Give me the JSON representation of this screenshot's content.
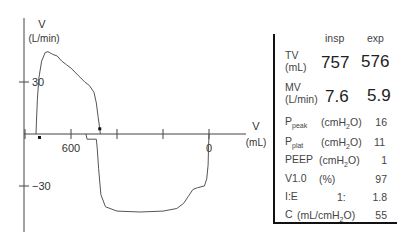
{
  "chart_data": {
    "type": "line",
    "ylabel": "V",
    "ylabel_unit": "(L/min)",
    "xlabel": "V",
    "xlabel_unit": "(mL)",
    "x_direction": "reversed",
    "xlim": [
      1100,
      -100
    ],
    "ylim": [
      -45,
      50
    ],
    "x_ticks": [
      800,
      600,
      400,
      200,
      0
    ],
    "x_tick_labels": [
      {
        "value": 600,
        "label": "600"
      },
      {
        "value": 0,
        "label": "0"
      }
    ],
    "y_ticks": [
      30,
      -30
    ],
    "y_tick_labels": [
      "30",
      "-30"
    ],
    "series": [
      {
        "name": "inspiration",
        "points": [
          [
            752,
            0
          ],
          [
            750,
            8
          ],
          [
            746,
            20
          ],
          [
            740,
            32
          ],
          [
            728,
            42
          ],
          [
            712,
            47
          ],
          [
            700,
            47.5
          ],
          [
            680,
            46
          ],
          [
            660,
            45
          ],
          [
            640,
            42
          ],
          [
            620,
            40
          ],
          [
            600,
            38
          ],
          [
            570,
            34
          ],
          [
            540,
            30
          ],
          [
            520,
            28
          ],
          [
            500,
            24
          ],
          [
            490,
            18
          ],
          [
            482,
            10
          ],
          [
            476,
            4
          ],
          [
            472,
            0
          ]
        ]
      },
      {
        "name": "expiration",
        "points": [
          [
            0,
            0
          ],
          [
            2,
            -8
          ],
          [
            4,
            -18
          ],
          [
            10,
            -26
          ],
          [
            20,
            -30
          ],
          [
            50,
            -31
          ],
          [
            70,
            -32
          ],
          [
            90,
            -36
          ],
          [
            110,
            -40
          ],
          [
            140,
            -43
          ],
          [
            200,
            -44.5
          ],
          [
            300,
            -45
          ],
          [
            400,
            -44.5
          ],
          [
            450,
            -42
          ],
          [
            470,
            -35
          ],
          [
            480,
            -20
          ],
          [
            486,
            -8
          ],
          [
            490,
            -3
          ],
          [
            530,
            -3
          ],
          [
            535,
            0
          ]
        ]
      }
    ],
    "markers": [
      {
        "x": 475,
        "y": 3
      },
      {
        "x": 737,
        "y": -2
      }
    ],
    "grid": false
  },
  "panel": {
    "headers": {
      "insp": "insp",
      "exp": "exp"
    },
    "tv": {
      "label": "TV",
      "unit": "(mL)",
      "insp": "757",
      "exp": "576"
    },
    "mv": {
      "label": "MV",
      "unit": "(L/min)",
      "insp": "7.6",
      "exp": "5.9"
    },
    "ppeak": {
      "label": "P",
      "sub": "peak",
      "unit": "(cmH",
      "unit_sub": "2",
      "unit_end": "O)",
      "value": "16"
    },
    "pplat": {
      "label": "P",
      "sub": "plat",
      "unit": "(cmH",
      "unit_sub": "2",
      "unit_end": "O)",
      "value": "11"
    },
    "peep": {
      "label": "PEEP",
      "unit": "(cmH",
      "unit_sub": "2",
      "unit_end": "O)",
      "value": "1"
    },
    "v10": {
      "label": "V1.0",
      "unit": "(%)",
      "value": "97"
    },
    "ie": {
      "label": "I:E",
      "mid": "1:",
      "value": "1.8"
    },
    "c": {
      "label": "C",
      "unit": "(mL/cmH",
      "unit_sub": "2",
      "unit_end": "O)",
      "value": "55"
    }
  }
}
